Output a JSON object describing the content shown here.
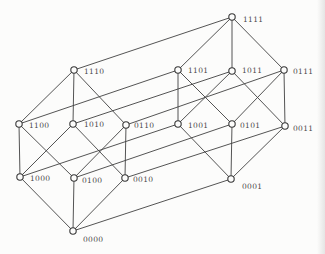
{
  "figure": {
    "width": 325,
    "height": 254,
    "background": "#fcfcfb",
    "edge_color": "#414141",
    "edge_width": 0.9,
    "node_radius": 3.2,
    "node_fill": "#fcfcfb",
    "node_stroke": "#383838",
    "node_stroke_width": 1.1,
    "label_color": "#4a4a4a",
    "label_font_size": 7.5
  },
  "graph": {
    "nodes": [
      {
        "id": "1111",
        "label": "1111",
        "x": 232,
        "y": 17,
        "label_x": 243,
        "label_y": 19
      },
      {
        "id": "1110",
        "label": "1110",
        "x": 74,
        "y": 70,
        "label_x": 84,
        "label_y": 71
      },
      {
        "id": "1101",
        "label": "1101",
        "x": 178,
        "y": 70,
        "label_x": 188,
        "label_y": 70
      },
      {
        "id": "1011",
        "label": "1011",
        "x": 232,
        "y": 71,
        "label_x": 242,
        "label_y": 70
      },
      {
        "id": "0111",
        "label": "0111",
        "x": 284,
        "y": 70,
        "label_x": 293,
        "label_y": 71
      },
      {
        "id": "1100",
        "label": "1100",
        "x": 19,
        "y": 124,
        "label_x": 29,
        "label_y": 125
      },
      {
        "id": "1010",
        "label": "1010",
        "x": 73,
        "y": 124,
        "label_x": 84,
        "label_y": 124
      },
      {
        "id": "0110",
        "label": "0110",
        "x": 126,
        "y": 125,
        "label_x": 134,
        "label_y": 125
      },
      {
        "id": "1001",
        "label": "1001",
        "x": 178,
        "y": 124,
        "label_x": 188,
        "label_y": 125
      },
      {
        "id": "0101",
        "label": "0101",
        "x": 232,
        "y": 124,
        "label_x": 240,
        "label_y": 125
      },
      {
        "id": "0011",
        "label": "0011",
        "x": 285,
        "y": 126,
        "label_x": 293,
        "label_y": 128
      },
      {
        "id": "1000",
        "label": "1000",
        "x": 20,
        "y": 177,
        "label_x": 30,
        "label_y": 178
      },
      {
        "id": "0100",
        "label": "0100",
        "x": 74,
        "y": 178,
        "label_x": 82,
        "label_y": 180
      },
      {
        "id": "0010",
        "label": "0010",
        "x": 125,
        "y": 178,
        "label_x": 133,
        "label_y": 179
      },
      {
        "id": "0001",
        "label": "0001",
        "x": 231,
        "y": 179,
        "label_x": 242,
        "label_y": 186
      },
      {
        "id": "0000",
        "label": "0000",
        "x": 73,
        "y": 231,
        "label_x": 83,
        "label_y": 239
      }
    ],
    "edges": [
      [
        "1111",
        "1110"
      ],
      [
        "1111",
        "1101"
      ],
      [
        "1111",
        "1011"
      ],
      [
        "1111",
        "0111"
      ],
      [
        "1110",
        "1100"
      ],
      [
        "1110",
        "1010"
      ],
      [
        "1110",
        "0110"
      ],
      [
        "1101",
        "1100"
      ],
      [
        "1101",
        "1001"
      ],
      [
        "1101",
        "0101"
      ],
      [
        "1011",
        "1010"
      ],
      [
        "1011",
        "1001"
      ],
      [
        "1011",
        "0011"
      ],
      [
        "0111",
        "0110"
      ],
      [
        "0111",
        "0101"
      ],
      [
        "0111",
        "0011"
      ],
      [
        "1100",
        "1000"
      ],
      [
        "1100",
        "0100"
      ],
      [
        "1010",
        "1000"
      ],
      [
        "1010",
        "0010"
      ],
      [
        "0110",
        "0100"
      ],
      [
        "0110",
        "0010"
      ],
      [
        "1001",
        "1000"
      ],
      [
        "1001",
        "0001"
      ],
      [
        "0101",
        "0100"
      ],
      [
        "0101",
        "0001"
      ],
      [
        "0011",
        "0010"
      ],
      [
        "0011",
        "0001"
      ],
      [
        "1000",
        "0000"
      ],
      [
        "0100",
        "0000"
      ],
      [
        "0010",
        "0000"
      ],
      [
        "0001",
        "0000"
      ]
    ]
  }
}
